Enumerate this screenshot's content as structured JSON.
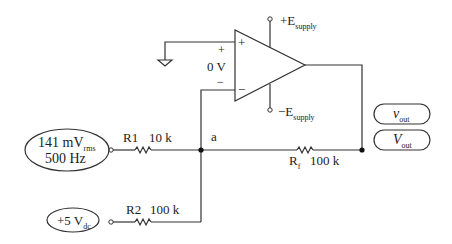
{
  "opamp": {
    "plus_sign": "+",
    "minus_sign": "−",
    "input_plus_label": "+",
    "input_minus_label": "−",
    "input_voltage_label": "0 V",
    "supply_pos": {
      "main": "+E",
      "sub": "supply"
    },
    "supply_neg": {
      "main": "−E",
      "sub": "supply"
    }
  },
  "sources": {
    "ac": {
      "line1_main": "141 mV",
      "line1_sub": "rms",
      "line2": "500 Hz"
    },
    "dc": {
      "main": "+5 V",
      "sub": "dc"
    }
  },
  "resistors": {
    "r1": {
      "name": "R1",
      "value": "10 k"
    },
    "r2": {
      "name": "R2",
      "value": "100 k"
    },
    "rf": {
      "name_main": "R",
      "name_sub": "f",
      "value": "100 k"
    }
  },
  "nodes": {
    "a": "a"
  },
  "outputs": {
    "ac": {
      "main": "v",
      "sub": "out"
    },
    "dc": {
      "main": "V",
      "sub": "out"
    }
  },
  "colors": {
    "line": "#333333",
    "background": "#ffffff"
  }
}
